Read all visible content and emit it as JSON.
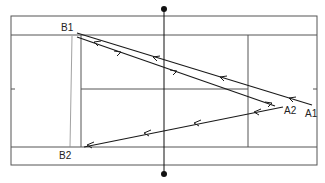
{
  "diagram": {
    "title": "",
    "type": "tennis-court-shot-diagram",
    "colors": {
      "court_lines": "#555555",
      "shots": "#1a1a1a",
      "net": "#111111",
      "background": "#ffffff"
    },
    "labels": {
      "B1": "B1",
      "B2": "B2",
      "A1": "A1",
      "A2": "A2"
    },
    "points": {
      "B1": {
        "x": 75,
        "y": 35
      },
      "B2": {
        "x": 80,
        "y": 148
      },
      "A1": {
        "x": 300,
        "y": 104
      },
      "A2": {
        "x": 275,
        "y": 106
      }
    },
    "shots": [
      {
        "from": "A1",
        "to": "B1",
        "direction": "left"
      },
      {
        "from": "B1",
        "to": "A2",
        "direction": "right"
      },
      {
        "from": "A2",
        "to": "B2",
        "direction": "left"
      }
    ]
  }
}
